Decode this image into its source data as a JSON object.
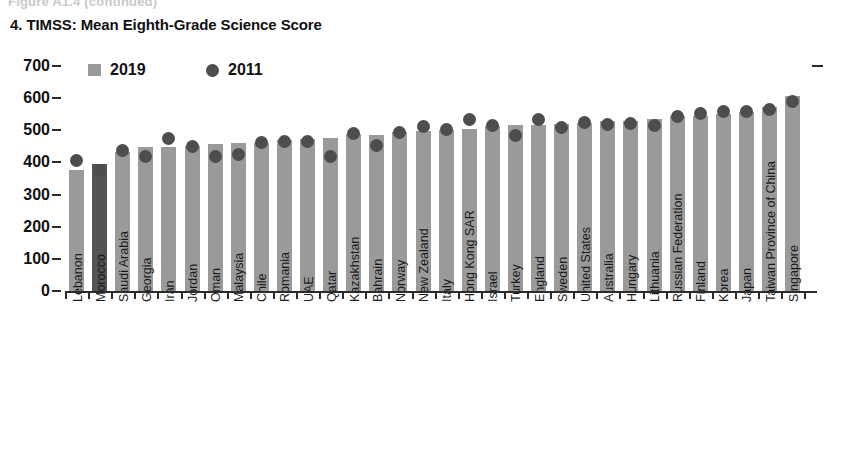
{
  "figure_continued_label": "Figure A1.4 (continued)",
  "chart_title": "4. TIMSS: Mean Eighth-Grade Science Score",
  "legend": [
    {
      "label": "2019",
      "marker": "square",
      "color": "#9a9a9a"
    },
    {
      "label": "2011",
      "marker": "circle",
      "color": "#4d4d4d"
    }
  ],
  "axis": {
    "y_ticks": [
      "700",
      "600",
      "500",
      "400",
      "300",
      "200",
      "100",
      "0"
    ],
    "y_min": 0,
    "y_max": 700,
    "y_step": 100
  },
  "colors": {
    "bar": "#9a9a9a",
    "bar_highlight": "#545454",
    "dot": "#4d4d4d",
    "axis": "#2b2b2b",
    "text": "#1a1a1a"
  },
  "chart_data": {
    "type": "bar",
    "title": "4. TIMSS: Mean Eighth-Grade Science Score",
    "xlabel": "",
    "ylabel": "",
    "ylim": [
      0,
      700
    ],
    "ytick_step": 100,
    "grid": false,
    "legend_position": "top-left",
    "highlight_category": "Morocco",
    "categories": [
      "Lebanon",
      "Morocco",
      "Saudi Arabia",
      "Georgia",
      "Iran",
      "Jordan",
      "Oman",
      "Malaysia",
      "Chile",
      "Romania",
      "UAE",
      "Qatar",
      "Kazakhstan",
      "Bahrain",
      "Norway",
      "New Zealand",
      "Italy",
      "Hong Kong SAR",
      "Israel",
      "Turkey",
      "England",
      "Sweden",
      "United States",
      "Australia",
      "Hungary",
      "Lithuania",
      "Russian Federation",
      "Finland",
      "Korea",
      "Japan",
      "Taiwan Province of China",
      "Singapore"
    ],
    "series": [
      {
        "name": "2019",
        "marker": "bar",
        "values": [
          377,
          394,
          431,
          447,
          449,
          452,
          457,
          460,
          462,
          470,
          473,
          475,
          490,
          486,
          495,
          499,
          500,
          504,
          513,
          515,
          517,
          521,
          522,
          528,
          530,
          534,
          543,
          543,
          552,
          558,
          574,
          608
        ]
      },
      {
        "name": "2011",
        "marker": "dot",
        "values": [
          406,
          376,
          436,
          420,
          474,
          449,
          420,
          426,
          461,
          465,
          465,
          419,
          490,
          452,
          494,
          512,
          501,
          535,
          516,
          483,
          533,
          509,
          525,
          519,
          522,
          514,
          542,
          552,
          560,
          558,
          564,
          590
        ]
      }
    ]
  }
}
